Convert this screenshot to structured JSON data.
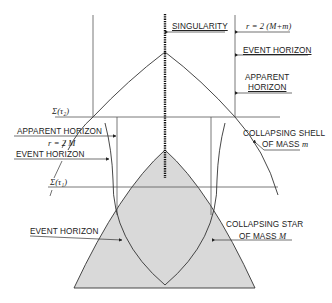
{
  "diagram": {
    "colors": {
      "line": "#333333",
      "star_fill": "#d9d9d9",
      "background": "#ffffff"
    },
    "labels": {
      "singularity": "SINGULARITY",
      "r_outer": "r = 2 (M+m)",
      "event_horizon_top": "EVENT HORIZON",
      "apparent_horizon_right_1": "APPARENT",
      "apparent_horizon_right_2": "HORIZON",
      "sigma_tau2": "Σ(τ₂)",
      "apparent_horizon_left": "APPARENT HORIZON",
      "r_inner": "r = 2 M",
      "event_horizon_left": "EVENT HORIZON",
      "collapsing_shell_1": "COLLAPSING SHELL",
      "collapsing_shell_2": "OF MASS",
      "shell_mass_symbol": "m",
      "sigma_tau1": "Σ(τ₁)",
      "event_horizon_bottom": "EVENT HORIZON",
      "collapsing_star_1": "COLLAPSING STAR",
      "collapsing_star_2": "OF MASS",
      "star_mass_symbol": "M"
    }
  }
}
